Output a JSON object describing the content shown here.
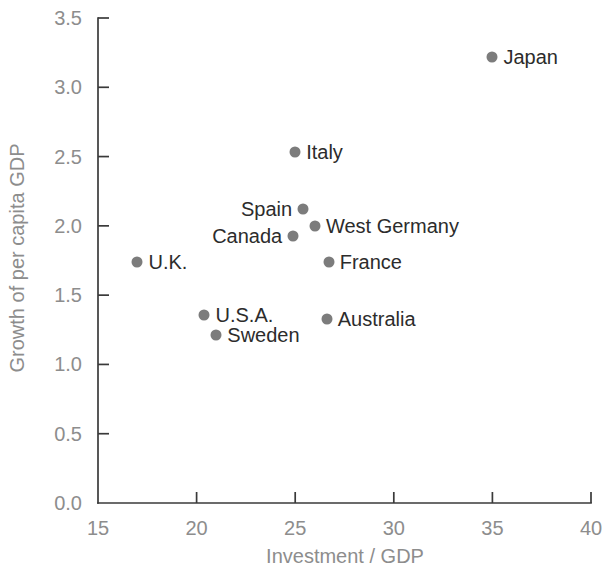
{
  "chart_data": {
    "type": "scatter",
    "title": "",
    "xlabel": "Investment / GDP",
    "ylabel": "Growth of per capita GDP",
    "xlim": [
      15,
      40
    ],
    "ylim": [
      0.0,
      3.5
    ],
    "xticks": [
      "15",
      "20",
      "25",
      "30",
      "35",
      "40"
    ],
    "yticks": [
      "0.0",
      "0.5",
      "1.0",
      "1.5",
      "2.0",
      "2.5",
      "3.0",
      "3.5"
    ],
    "grid": false,
    "legend": "none",
    "marker_color": "#7c7c7c",
    "axis_color": "#3a3a3a",
    "tick_label_color": "#8d8d8d",
    "point_label_color": "#2c2c2c",
    "points": [
      {
        "label": "Japan",
        "x": 35.0,
        "y": 3.22,
        "label_side": "right"
      },
      {
        "label": "Italy",
        "x": 25.0,
        "y": 2.53,
        "label_side": "right"
      },
      {
        "label": "Spain",
        "x": 25.4,
        "y": 2.12,
        "label_side": "left"
      },
      {
        "label": "West Germany",
        "x": 26.0,
        "y": 2.0,
        "label_side": "right"
      },
      {
        "label": "Canada",
        "x": 24.9,
        "y": 1.93,
        "label_side": "left"
      },
      {
        "label": "France",
        "x": 26.7,
        "y": 1.74,
        "label_side": "right"
      },
      {
        "label": "U.K.",
        "x": 17.0,
        "y": 1.74,
        "label_side": "right"
      },
      {
        "label": "U.S.A.",
        "x": 20.4,
        "y": 1.36,
        "label_side": "right"
      },
      {
        "label": "Australia",
        "x": 26.6,
        "y": 1.33,
        "label_side": "right"
      },
      {
        "label": "Sweden",
        "x": 21.0,
        "y": 1.21,
        "label_side": "right"
      }
    ]
  }
}
